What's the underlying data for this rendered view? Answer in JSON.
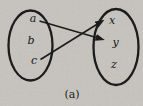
{
  "figure": {
    "diagram_type": "set-mapping",
    "caption": "(a)",
    "left_set": {
      "elements": [
        "a",
        "b",
        "c"
      ]
    },
    "right_set": {
      "elements": [
        "x",
        "y",
        "z"
      ]
    },
    "mappings": [
      {
        "from": "a",
        "to": "y"
      },
      {
        "from": "c",
        "to": "x"
      }
    ],
    "colors": {
      "ink": "#1c1c1c",
      "paper": "#d7d4ce"
    }
  }
}
